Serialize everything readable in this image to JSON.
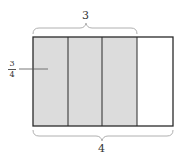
{
  "diagram": {
    "top_brace_label": "3",
    "bottom_brace_label": "4",
    "side_fraction": {
      "numerator": "3",
      "denominator": "4"
    },
    "columns": 4,
    "shaded_columns": 3,
    "colors": {
      "shaded": "#dcdcdc",
      "unshaded": "#ffffff",
      "outline": "#2a2a2a",
      "brace": "#b0b0b0",
      "leader": "#555555"
    }
  }
}
